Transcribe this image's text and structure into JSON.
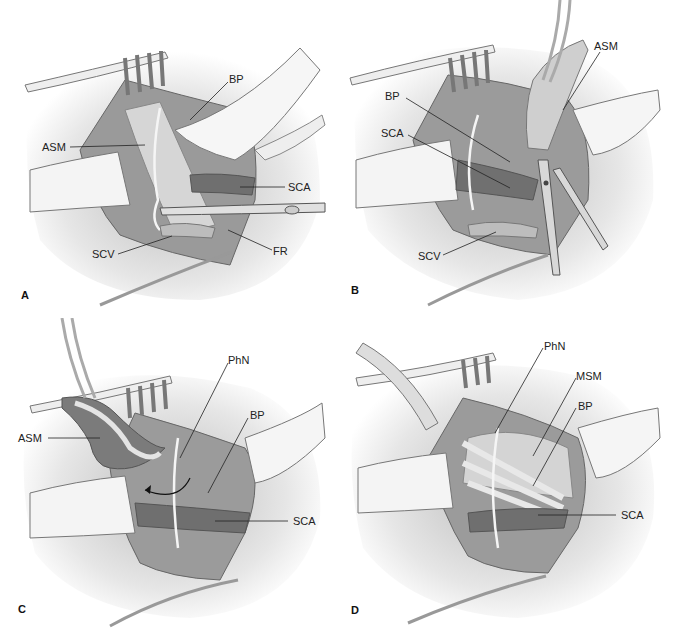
{
  "figure": {
    "panels": [
      {
        "id": "A",
        "letter": "A",
        "labels": [
          {
            "text": "ASM",
            "structure": "anterior scalene muscle"
          },
          {
            "text": "BP",
            "structure": "brachial plexus"
          },
          {
            "text": "SCA",
            "structure": "subclavian artery"
          },
          {
            "text": "SCV",
            "structure": "subclavian vein"
          },
          {
            "text": "FR",
            "structure": "first rib"
          }
        ]
      },
      {
        "id": "B",
        "letter": "B",
        "labels": [
          {
            "text": "ASM",
            "structure": "anterior scalene muscle"
          },
          {
            "text": "BP",
            "structure": "brachial plexus"
          },
          {
            "text": "SCA",
            "structure": "subclavian artery"
          },
          {
            "text": "SCV",
            "structure": "subclavian vein"
          }
        ]
      },
      {
        "id": "C",
        "letter": "C",
        "labels": [
          {
            "text": "ASM",
            "structure": "anterior scalene muscle"
          },
          {
            "text": "PhN",
            "structure": "phrenic nerve"
          },
          {
            "text": "BP",
            "structure": "brachial plexus"
          },
          {
            "text": "SCA",
            "structure": "subclavian artery"
          }
        ]
      },
      {
        "id": "D",
        "letter": "D",
        "labels": [
          {
            "text": "PhN",
            "structure": "phrenic nerve"
          },
          {
            "text": "MSM",
            "structure": "middle scalene muscle"
          },
          {
            "text": "BP",
            "structure": "brachial plexus"
          },
          {
            "text": "SCA",
            "structure": "subclavian artery"
          }
        ]
      }
    ],
    "colors": {
      "tissue": "#d9d9d9",
      "shadow": "#8a8a8a",
      "artery": "#6e6e6e",
      "retractor": "#f2f2f2",
      "outline": "#555555"
    }
  }
}
